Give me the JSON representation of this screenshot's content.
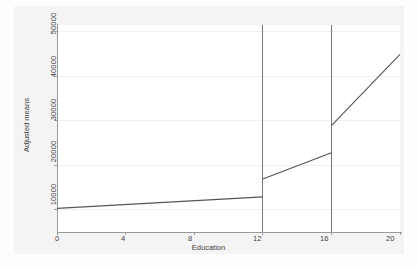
{
  "chart_data": {
    "type": "line",
    "title": "",
    "xlabel": "Education",
    "ylabel": "Adjusted means",
    "xlim": [
      0,
      20
    ],
    "ylim": [
      5000,
      51500
    ],
    "xticks": [
      0,
      4,
      8,
      12,
      16,
      20
    ],
    "xticklabels": [
      "0",
      "4",
      "8",
      "12",
      "16",
      "20"
    ],
    "yticks": [
      10000,
      20000,
      30000,
      40000,
      50000
    ],
    "yticklabels": [
      "10000",
      "20000",
      "30000",
      "40000",
      "50000"
    ],
    "grid": "horizontal",
    "legend": "none",
    "line_color": "#555555",
    "refline_color": "#777777",
    "grid_color": "#f0f0f0",
    "axis_color": "#9a9a9a",
    "plot_background": "#ffffff",
    "graph_background": "#f4f4f4",
    "reference_lines": [
      {
        "x": 12,
        "label": "12"
      },
      {
        "x": 16,
        "label": "16"
      }
    ],
    "series": [
      {
        "name": "Adjusted means (0-12 years)",
        "points": [
          {
            "x": 0,
            "y": 10300
          },
          {
            "x": 12,
            "y": 12900
          }
        ]
      },
      {
        "name": "Adjusted means (12-16 years)",
        "points": [
          {
            "x": 12,
            "y": 16900
          },
          {
            "x": 16,
            "y": 22800
          }
        ]
      },
      {
        "name": "Adjusted means (16-20 years)",
        "points": [
          {
            "x": 16,
            "y": 28900
          },
          {
            "x": 20,
            "y": 44900
          }
        ]
      }
    ],
    "discontinuities": [
      {
        "x": 12,
        "from": 12900,
        "to": 16900
      },
      {
        "x": 16,
        "from": 22800,
        "to": 28900
      }
    ]
  }
}
